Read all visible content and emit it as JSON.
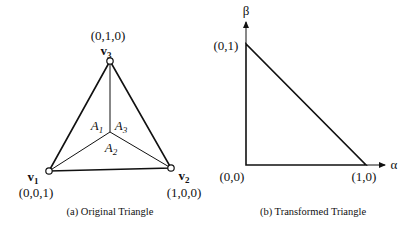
{
  "figures": [
    {
      "id": "a",
      "caption": "(a)  Original Triangle",
      "vertices": [
        {
          "name": "v",
          "sub": "1",
          "coord": "(0,0,1)"
        },
        {
          "name": "v",
          "sub": "2",
          "coord": "(1,0,0)"
        },
        {
          "name": "v",
          "sub": "3",
          "coord": "(0,1,0)"
        }
      ],
      "areas": [
        {
          "name": "A",
          "sub": "1"
        },
        {
          "name": "A",
          "sub": "2"
        },
        {
          "name": "A",
          "sub": "3"
        }
      ]
    },
    {
      "id": "b",
      "caption": "(b)  Transformed Triangle",
      "points": [
        {
          "coord": "(0,0)"
        },
        {
          "coord": "(1,0)"
        },
        {
          "coord": "(0,1)"
        }
      ],
      "axes": {
        "x_label": "α",
        "y_label": "β"
      }
    }
  ],
  "colors": {
    "stroke": "#111111",
    "background": "#ffffff"
  }
}
